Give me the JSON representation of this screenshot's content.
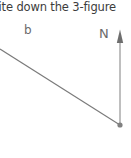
{
  "canvas": {
    "width": 131,
    "height": 158,
    "background": "#ffffff"
  },
  "question": {
    "text": "rite down the 3-figure",
    "note_clipped": true,
    "color": "#3c3c3c"
  },
  "diagram": {
    "type": "bearing-diagram",
    "line_color": "#7a7a7a",
    "vertex_color": "#808080",
    "labels": {
      "point_b": "b",
      "north": "N"
    },
    "vertex": {
      "x": 120,
      "y": 125
    },
    "north_arrow": {
      "tip_x": 120,
      "tip_y": 30,
      "base_x": 120,
      "base_y": 125
    },
    "bearing_line": {
      "start_x": 0,
      "start_y": 49,
      "end_x": 120,
      "end_y": 125
    }
  }
}
